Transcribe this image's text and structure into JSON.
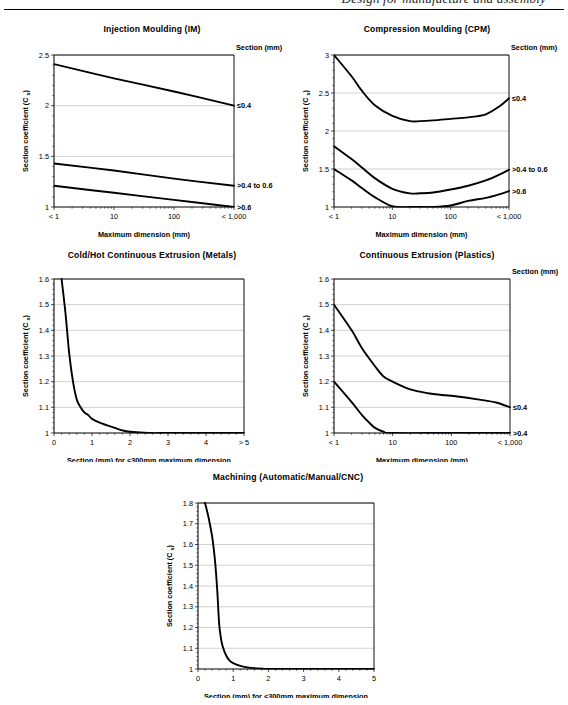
{
  "header": {
    "text": "Design for manufacture and assembly",
    "rule": true
  },
  "axis_titles": {
    "y_main": "Section coefficient (C",
    "y_sub": "s",
    "y_close": ")",
    "x_log": "Maximum dimension (mm)",
    "x_linear": "Section (mm) for <300mm maximum dimension",
    "legend_head": "Section (mm)"
  },
  "chart_data": [
    {
      "id": "injection-moulding",
      "type": "line",
      "title": "Injection Moulding (IM)",
      "xlabel": "Maximum dimension (mm)",
      "ylabel": "Section coefficient (C s)",
      "xscale": "log",
      "xlim": [
        1,
        1000
      ],
      "ylim": [
        1,
        2.5
      ],
      "ytick_labels": [
        "1",
        "1.5",
        "2",
        "2.5"
      ],
      "ytick_values": [
        1,
        1.5,
        2,
        2.5
      ],
      "xtick_labels": [
        "< 1",
        "10",
        "100",
        "< 1,000"
      ],
      "xtick_values": [
        1,
        10,
        100,
        1000
      ],
      "grid": true,
      "legend_title": "Section (mm)",
      "legend_position": "right-axis",
      "series": [
        {
          "name": "≤0.4",
          "x": [
            1,
            10,
            100,
            1000
          ],
          "values": [
            2.41,
            2.27,
            2.14,
            2.0
          ]
        },
        {
          "name": ">0.4 to 0.6",
          "x": [
            1,
            10,
            100,
            1000
          ],
          "values": [
            1.43,
            1.36,
            1.28,
            1.21
          ]
        },
        {
          "name": ">0.6",
          "x": [
            1,
            10,
            100,
            1000
          ],
          "values": [
            1.21,
            1.14,
            1.07,
            1.0
          ]
        }
      ]
    },
    {
      "id": "compression-moulding",
      "type": "line",
      "title": "Compression Moulding (CPM)",
      "xlabel": "Maximum dimension (mm)",
      "ylabel": "Section coefficient (C s)",
      "xscale": "log",
      "xlim": [
        1,
        1000
      ],
      "ylim": [
        1,
        3
      ],
      "ytick_labels": [
        "1",
        "1.5",
        "2",
        "2.5",
        "3"
      ],
      "ytick_values": [
        1,
        1.5,
        2,
        2.5,
        3
      ],
      "xtick_labels": [
        "< 1",
        "10",
        "100",
        "< 1,000"
      ],
      "xtick_values": [
        1,
        10,
        100,
        1000
      ],
      "grid": true,
      "legend_title": "Section (mm)",
      "legend_position": "right-axis",
      "series": [
        {
          "name": "≤0.4",
          "x": [
            1,
            2,
            3,
            5,
            10,
            20,
            30,
            50,
            100,
            200,
            400,
            700,
            1000
          ],
          "values": [
            3.0,
            2.72,
            2.53,
            2.34,
            2.2,
            2.13,
            2.13,
            2.14,
            2.16,
            2.18,
            2.22,
            2.33,
            2.43
          ]
        },
        {
          "name": ">0.4 to 0.6",
          "x": [
            1,
            2,
            3,
            5,
            10,
            20,
            30,
            50,
            100,
            200,
            400,
            700,
            1000
          ],
          "values": [
            1.8,
            1.63,
            1.52,
            1.38,
            1.24,
            1.18,
            1.18,
            1.19,
            1.23,
            1.28,
            1.35,
            1.43,
            1.49
          ]
        },
        {
          "name": ">0.6",
          "x": [
            1,
            2,
            3,
            5,
            10,
            20,
            30,
            50,
            100,
            200,
            400,
            700,
            1000
          ],
          "values": [
            1.5,
            1.35,
            1.25,
            1.13,
            1.01,
            1.0,
            1.0,
            1.0,
            1.02,
            1.08,
            1.12,
            1.17,
            1.21
          ]
        }
      ]
    },
    {
      "id": "cold-hot-continuous-extrusion-metals",
      "type": "line",
      "title": "Cold/Hot Continuous Extrusion (Metals)",
      "xlabel": "Section (mm) for <300mm maximum dimension",
      "ylabel": "Section coefficient (C s)",
      "xscale": "linear",
      "xlim": [
        0,
        5
      ],
      "ylim": [
        1,
        1.6
      ],
      "ytick_labels": [
        "1",
        "1.1",
        "1.2",
        "1.3",
        "1.4",
        "1.5",
        "1.6"
      ],
      "ytick_values": [
        1,
        1.1,
        1.2,
        1.3,
        1.4,
        1.5,
        1.6
      ],
      "xtick_labels": [
        "0",
        "1",
        "2",
        "3",
        "4",
        "> 5"
      ],
      "xtick_values": [
        0,
        1,
        2,
        3,
        4,
        5
      ],
      "grid": true,
      "legend_title": null,
      "series": [
        {
          "name": "",
          "x": [
            0.2,
            0.3,
            0.4,
            0.5,
            0.6,
            0.7,
            0.8,
            0.9,
            1.0,
            1.2,
            1.4,
            1.6,
            1.8,
            2.0,
            2.5,
            3.0,
            4.0,
            5.0
          ],
          "values": [
            1.6,
            1.47,
            1.31,
            1.2,
            1.13,
            1.1,
            1.08,
            1.07,
            1.055,
            1.04,
            1.03,
            1.02,
            1.01,
            1.005,
            1.0,
            1.0,
            1.0,
            1.0
          ]
        }
      ]
    },
    {
      "id": "continuous-extrusion-plastics",
      "type": "line",
      "title": "Continuous Extrusion (Plastics)",
      "xlabel": "Maximum dimension (mm)",
      "ylabel": "Section coefficient (C s)",
      "xscale": "log",
      "xlim": [
        1,
        1000
      ],
      "ylim": [
        1,
        1.6
      ],
      "ytick_labels": [
        "1",
        "1.1",
        "1.2",
        "1.3",
        "1.4",
        "1.5",
        "1.6"
      ],
      "ytick_values": [
        1,
        1.1,
        1.2,
        1.3,
        1.4,
        1.5,
        1.6
      ],
      "xtick_labels": [
        "< 1",
        "10",
        "100",
        "< 1,000"
      ],
      "xtick_values": [
        1,
        10,
        100,
        1000
      ],
      "grid": true,
      "legend_title": "Section (mm)",
      "legend_position": "right-axis",
      "series": [
        {
          "name": "≤0.4",
          "x": [
            1,
            2,
            3,
            5,
            7,
            10,
            20,
            40,
            70,
            100,
            300,
            600,
            1000
          ],
          "values": [
            1.5,
            1.4,
            1.33,
            1.26,
            1.22,
            1.2,
            1.17,
            1.155,
            1.148,
            1.145,
            1.13,
            1.118,
            1.1
          ]
        },
        {
          "name": ">0.4",
          "x": [
            1,
            2,
            3,
            4,
            5,
            7,
            10,
            100,
            1000
          ],
          "values": [
            1.2,
            1.12,
            1.07,
            1.04,
            1.02,
            1.005,
            1.0,
            1.0,
            1.0
          ]
        }
      ]
    },
    {
      "id": "machining",
      "type": "line",
      "title": "Machining (Automatic/Manual/CNC)",
      "xlabel": "Section (mm) for <300mm maximum dimension",
      "ylabel": "Section coefficient (C s)",
      "xscale": "linear",
      "xlim": [
        0,
        5
      ],
      "ylim": [
        1,
        1.8
      ],
      "ytick_labels": [
        "1",
        "1.1",
        "1.2",
        "1.3",
        "1.4",
        "1.5",
        "1.6",
        "1.7",
        "1.8"
      ],
      "ytick_values": [
        1,
        1.1,
        1.2,
        1.3,
        1.4,
        1.5,
        1.6,
        1.7,
        1.8
      ],
      "xtick_labels": [
        "0",
        "1",
        "2",
        "3",
        "4",
        "5"
      ],
      "xtick_values": [
        0,
        1,
        2,
        3,
        4,
        5
      ],
      "grid": true,
      "legend_title": null,
      "series": [
        {
          "name": "",
          "x": [
            0.2,
            0.3,
            0.4,
            0.45,
            0.5,
            0.55,
            0.6,
            0.65,
            0.7,
            0.8,
            0.9,
            1.0,
            1.2,
            1.4,
            1.6,
            1.8,
            2.0,
            3.0,
            4.0,
            5.0
          ],
          "values": [
            1.8,
            1.73,
            1.64,
            1.575,
            1.49,
            1.37,
            1.22,
            1.15,
            1.11,
            1.065,
            1.04,
            1.028,
            1.015,
            1.008,
            1.004,
            1.002,
            1.0,
            1.0,
            1.0,
            1.0
          ]
        }
      ]
    }
  ],
  "layout": [
    {
      "id": "injection-moulding",
      "left": 16,
      "top": 24,
      "width": 272,
      "height": 215,
      "plot": {
        "x": 38,
        "y": 18,
        "w": 180,
        "h": 152
      }
    },
    {
      "id": "compression-moulding",
      "left": 294,
      "top": 24,
      "width": 266,
      "height": 215,
      "plot": {
        "x": 40,
        "y": 18,
        "w": 175,
        "h": 152
      }
    },
    {
      "id": "cold-hot-continuous-extrusion-metals",
      "left": 16,
      "top": 250,
      "width": 272,
      "height": 212,
      "plot": {
        "x": 38,
        "y": 16,
        "w": 190,
        "h": 154
      }
    },
    {
      "id": "continuous-extrusion-plastics",
      "left": 294,
      "top": 250,
      "width": 266,
      "height": 212,
      "plot": {
        "x": 40,
        "y": 16,
        "w": 176,
        "h": 154
      }
    },
    {
      "id": "machining",
      "left": 152,
      "top": 472,
      "width": 272,
      "height": 226,
      "plot": {
        "x": 46,
        "y": 18,
        "w": 176,
        "h": 166
      }
    }
  ]
}
